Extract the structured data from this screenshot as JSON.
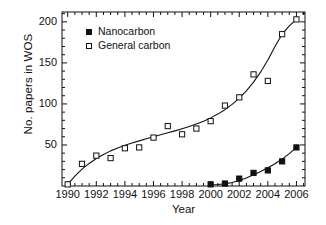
{
  "chart_data": {
    "type": "scatter",
    "title": "",
    "xlabel": "Year",
    "ylabel": "No. papers in WOS",
    "xlim": [
      1989.6,
      2006.6
    ],
    "ylim": [
      0,
      212
    ],
    "xticks": [
      1990,
      1992,
      1994,
      1996,
      1998,
      2000,
      2002,
      2004,
      2006
    ],
    "xtick_labels": [
      "1990",
      "1992",
      "1994",
      "1996",
      "1998",
      "2000",
      "2002",
      "2004",
      "2006"
    ],
    "xminor_step": 0.5,
    "yticks": [
      50,
      100,
      150,
      200
    ],
    "ytick_labels": [
      "50",
      "100",
      "150",
      "200"
    ],
    "yminor_step": 10,
    "grid": false,
    "legend_position": "upper-left-inside",
    "x": [
      1990,
      1991,
      1992,
      1993,
      1994,
      1995,
      1996,
      1997,
      1998,
      1999,
      2000,
      2001,
      2002,
      2003,
      2004,
      2005,
      2006
    ],
    "series": [
      {
        "name": "Nanocarbon",
        "marker": "filled-square",
        "color": "#111111",
        "x": [
          2000,
          2001,
          2002,
          2003,
          2004,
          2005,
          2006
        ],
        "values": [
          2,
          3,
          9,
          16,
          19,
          30,
          47
        ],
        "fit_curve": [
          [
            2000,
            1.5
          ],
          [
            2000.5,
            1.8
          ],
          [
            2001,
            2.6
          ],
          [
            2001.5,
            4.2
          ],
          [
            2002,
            6.6
          ],
          [
            2002.5,
            9.8
          ],
          [
            2003,
            13.6
          ],
          [
            2003.5,
            17.8
          ],
          [
            2004,
            22.2
          ],
          [
            2004.5,
            27.2
          ],
          [
            2005,
            32.8
          ],
          [
            2005.5,
            39.4
          ],
          [
            2006,
            47.0
          ]
        ]
      },
      {
        "name": "General carbon",
        "marker": "open-square",
        "color": "#111111",
        "x": [
          1990,
          1991,
          1992,
          1993,
          1994,
          1995,
          1996,
          1997,
          1998,
          1999,
          2000,
          2001,
          2002,
          2003,
          2004,
          2005,
          2006
        ],
        "values": [
          2,
          27,
          37,
          34,
          46,
          47,
          59,
          73,
          63,
          70,
          79,
          98,
          108,
          136,
          128,
          185,
          203
        ],
        "fit_curve": [
          [
            1990,
            2.0
          ],
          [
            1990.5,
            12.0
          ],
          [
            1991,
            20.5
          ],
          [
            1991.5,
            27.5
          ],
          [
            1992,
            33.5
          ],
          [
            1992.5,
            38.5
          ],
          [
            1993,
            42.8
          ],
          [
            1993.5,
            46.4
          ],
          [
            1994,
            49.6
          ],
          [
            1994.5,
            52.4
          ],
          [
            1995,
            55.0
          ],
          [
            1995.5,
            57.6
          ],
          [
            1996,
            60.0
          ],
          [
            1996.5,
            62.4
          ],
          [
            1997,
            64.8
          ],
          [
            1997.5,
            67.2
          ],
          [
            1998,
            69.8
          ],
          [
            1998.5,
            72.6
          ],
          [
            1999,
            75.6
          ],
          [
            1999.5,
            79.0
          ],
          [
            2000,
            83.0
          ],
          [
            2000.5,
            87.6
          ],
          [
            2001,
            93.0
          ],
          [
            2001.5,
            99.4
          ],
          [
            2002,
            107.0
          ],
          [
            2002.5,
            116.0
          ],
          [
            2003,
            126.5
          ],
          [
            2003.5,
            139.0
          ],
          [
            2004,
            153.5
          ],
          [
            2004.5,
            170.0
          ],
          [
            2005,
            185.0
          ],
          [
            2005.5,
            195.0
          ],
          [
            2006,
            203.0
          ]
        ]
      }
    ]
  },
  "legend": {
    "items": [
      {
        "label": "Nanocarbon",
        "marker": "filled-square"
      },
      {
        "label": "General carbon",
        "marker": "open-square"
      }
    ]
  },
  "axes": {
    "x_title": "Year",
    "y_title": "No. papers in WOS"
  }
}
